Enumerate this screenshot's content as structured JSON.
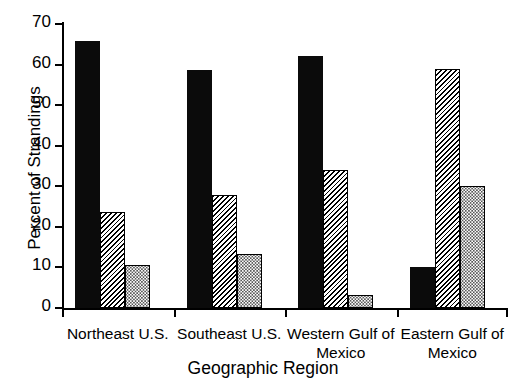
{
  "chart_data": {
    "type": "bar",
    "title": "",
    "xlabel": "Geographic Region",
    "ylabel": "Percent of Strandings",
    "categories": [
      "Northeast U.S.",
      "Southeast U.S.",
      "Western Gulf of\nMexico",
      "Eastern Gulf of\nMexico"
    ],
    "category_lines": [
      [
        "Northeast U.S."
      ],
      [
        "Southeast U.S."
      ],
      [
        "Western Gulf of",
        "Mexico"
      ],
      [
        "Eastern Gulf of",
        "Mexico"
      ]
    ],
    "series": [
      {
        "name": "series-1-solid-black",
        "pattern": "solid",
        "values": [
          65.8,
          58.7,
          62.0,
          10.2
        ]
      },
      {
        "name": "series-2-diagonal-hatch",
        "pattern": "hatch",
        "values": [
          23.6,
          27.9,
          34.0,
          58.8
        ]
      },
      {
        "name": "series-3-dotted",
        "pattern": "dots",
        "values": [
          10.7,
          13.3,
          3.3,
          30.0
        ]
      }
    ],
    "ylim": [
      0,
      70
    ],
    "yticks": [
      0,
      10,
      20,
      30,
      40,
      50,
      60,
      70
    ],
    "ytick_labels": [
      "0",
      "10",
      "20",
      "30",
      "40",
      "50",
      "60",
      "70"
    ],
    "grid": false,
    "legend": "none",
    "colors": {
      "solid": "#0b0b0b",
      "hatch_line": "#000000",
      "dots": "#1a1a1a",
      "axis": "#000000",
      "background": "#ffffff"
    }
  }
}
